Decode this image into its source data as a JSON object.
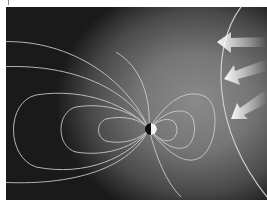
{
  "figure": {
    "elements": [
      "earth",
      "magnetic-field-lines",
      "bow-shock",
      "solar-wind-arrows"
    ],
    "colors": {
      "background_dark": "#111111",
      "background_light": "#8a8a8a",
      "lines": "#d8d8d8",
      "arrows": "#f0f0f0"
    }
  }
}
